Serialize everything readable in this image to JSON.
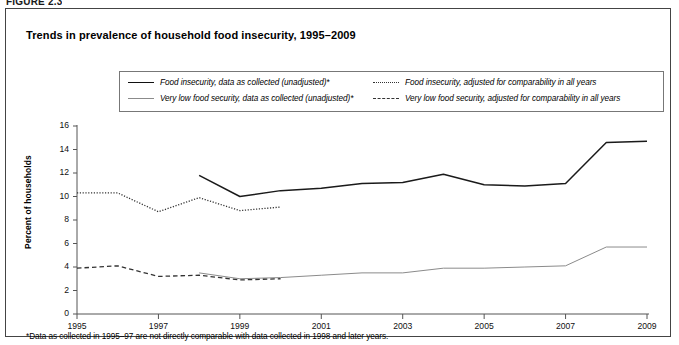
{
  "figure": {
    "tag": "FIGURE 2.3",
    "title": "Trends in prevalence of household food insecurity, 1995–2009",
    "footnote": "*Data as collected in 1995–97 are not directly comparable with data collected in 1998 and later years."
  },
  "legend": {
    "items": [
      {
        "id": "fi-collected",
        "style": "solid-dark",
        "label": "Food insecurity, data as collected (unadjusted)*"
      },
      {
        "id": "vlfs-collected",
        "style": "solid-gray",
        "label": "Very low food security, data as collected (unadjusted)*"
      },
      {
        "id": "fi-adjusted",
        "style": "dotted",
        "label": "Food insecurity, adjusted for comparability in all years"
      },
      {
        "id": "vlfs-adjusted",
        "style": "dashed",
        "label": "Very low food security, adjusted for comparability in all years"
      }
    ]
  },
  "chart_data": {
    "type": "line",
    "title": "Trends in prevalence of household food insecurity, 1995–2009",
    "xlabel": "",
    "ylabel": "Percent of households",
    "xlim": [
      1995,
      2009
    ],
    "ylim": [
      0,
      16
    ],
    "ytick_labels": [
      "0",
      "2",
      "4",
      "6",
      "8",
      "10",
      "12",
      "14",
      "16"
    ],
    "ytick_values": [
      0,
      2,
      4,
      6,
      8,
      10,
      12,
      14,
      16
    ],
    "xtick_labels": [
      "1995",
      "1997",
      "1999",
      "2001",
      "2003",
      "2005",
      "2007",
      "2009"
    ],
    "xtick_values": [
      1995,
      1997,
      1999,
      2001,
      2003,
      2005,
      2007,
      2009
    ],
    "grid": false,
    "legend_position": "top",
    "series": [
      {
        "name": "Food insecurity, data as collected (unadjusted)*",
        "style": "solid-dark",
        "x": [
          1998,
          1999,
          2000,
          2001,
          2002,
          2003,
          2004,
          2005,
          2006,
          2007,
          2008,
          2009
        ],
        "values": [
          11.8,
          10.0,
          10.5,
          10.7,
          11.1,
          11.2,
          11.9,
          11.0,
          10.9,
          11.1,
          14.6,
          14.7
        ]
      },
      {
        "name": "Food insecurity, adjusted for comparability in all years",
        "style": "dotted",
        "x": [
          1995,
          1996,
          1997,
          1998,
          1999,
          2000
        ],
        "values": [
          10.3,
          10.3,
          8.7,
          9.9,
          8.8,
          9.1
        ]
      },
      {
        "name": "Very low food security, data as collected (unadjusted)*",
        "style": "solid-gray",
        "x": [
          1998,
          1999,
          2000,
          2001,
          2002,
          2003,
          2004,
          2005,
          2006,
          2007,
          2008,
          2009
        ],
        "values": [
          3.5,
          3.0,
          3.1,
          3.3,
          3.5,
          3.5,
          3.9,
          3.9,
          4.0,
          4.1,
          5.7,
          5.7
        ]
      },
      {
        "name": "Very low food security, adjusted for comparability in all years",
        "style": "dashed",
        "x": [
          1995,
          1996,
          1997,
          1998,
          1999,
          2000
        ],
        "values": [
          3.9,
          4.1,
          3.2,
          3.3,
          2.9,
          3.0
        ]
      }
    ]
  },
  "colors": {
    "solid_dark": "#1a1a1a",
    "solid_gray": "#8b8b8b",
    "dotted": "#333333",
    "dashed": "#333333",
    "axis": "#555555",
    "border": "#444444"
  }
}
